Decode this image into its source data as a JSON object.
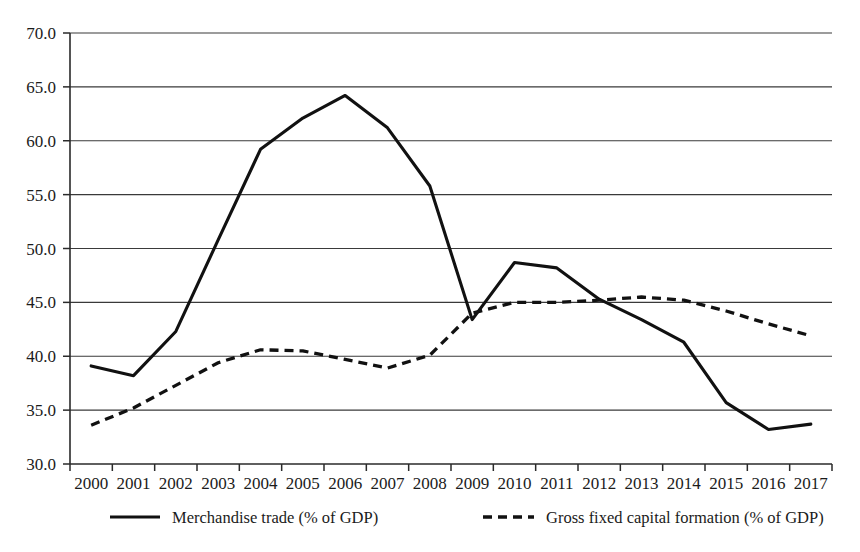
{
  "chart_data": {
    "type": "line",
    "title": "",
    "subtitle": "",
    "xlabel": "",
    "ylabel": "",
    "categories": [
      "2000",
      "2001",
      "2002",
      "2003",
      "2004",
      "2005",
      "2006",
      "2007",
      "2008",
      "2009",
      "2010",
      "2011",
      "2012",
      "2013",
      "2014",
      "2015",
      "2016",
      "2017"
    ],
    "x": [
      2000,
      2001,
      2002,
      2003,
      2004,
      2005,
      2006,
      2007,
      2008,
      2009,
      2010,
      2011,
      2012,
      2013,
      2014,
      2015,
      2016,
      2017
    ],
    "series": [
      {
        "name": "Merchandise trade (% of GDP)",
        "style": "solid",
        "color": "#111111",
        "values": [
          39.1,
          38.2,
          42.3,
          50.8,
          59.2,
          62.1,
          64.2,
          61.2,
          55.8,
          43.4,
          48.7,
          48.2,
          45.3,
          43.4,
          41.3,
          35.7,
          33.2,
          33.7
        ]
      },
      {
        "name": "Gross fixed capital formation (% of GDP)",
        "style": "dashed",
        "color": "#111111",
        "values": [
          33.6,
          35.2,
          37.3,
          39.4,
          40.6,
          40.5,
          39.7,
          38.9,
          40.1,
          44.0,
          45.0,
          45.0,
          45.2,
          45.5,
          45.2,
          44.2,
          43.0,
          41.9
        ]
      }
    ],
    "ylim": [
      30.0,
      70.0
    ],
    "ytick_step": 5.0,
    "ytick_labels": [
      "30.0",
      "35.0",
      "40.0",
      "45.0",
      "50.0",
      "55.0",
      "60.0",
      "65.0",
      "70.0"
    ],
    "ytick_values": [
      30.0,
      35.0,
      40.0,
      45.0,
      50.0,
      55.0,
      60.0,
      65.0,
      70.0
    ],
    "grid": "horizontal",
    "legend_position": "bottom",
    "legend": [
      {
        "label": "Merchandise trade (% of GDP)",
        "style": "solid"
      },
      {
        "label": "Gross fixed capital formation (% of GDP)",
        "style": "dashed"
      }
    ]
  },
  "accent_colors": {
    "line": "#111111",
    "grid": "#3a3a3a",
    "axis": "#2a2a2a",
    "background": "#ffffff",
    "text": "#1b1b1b"
  }
}
